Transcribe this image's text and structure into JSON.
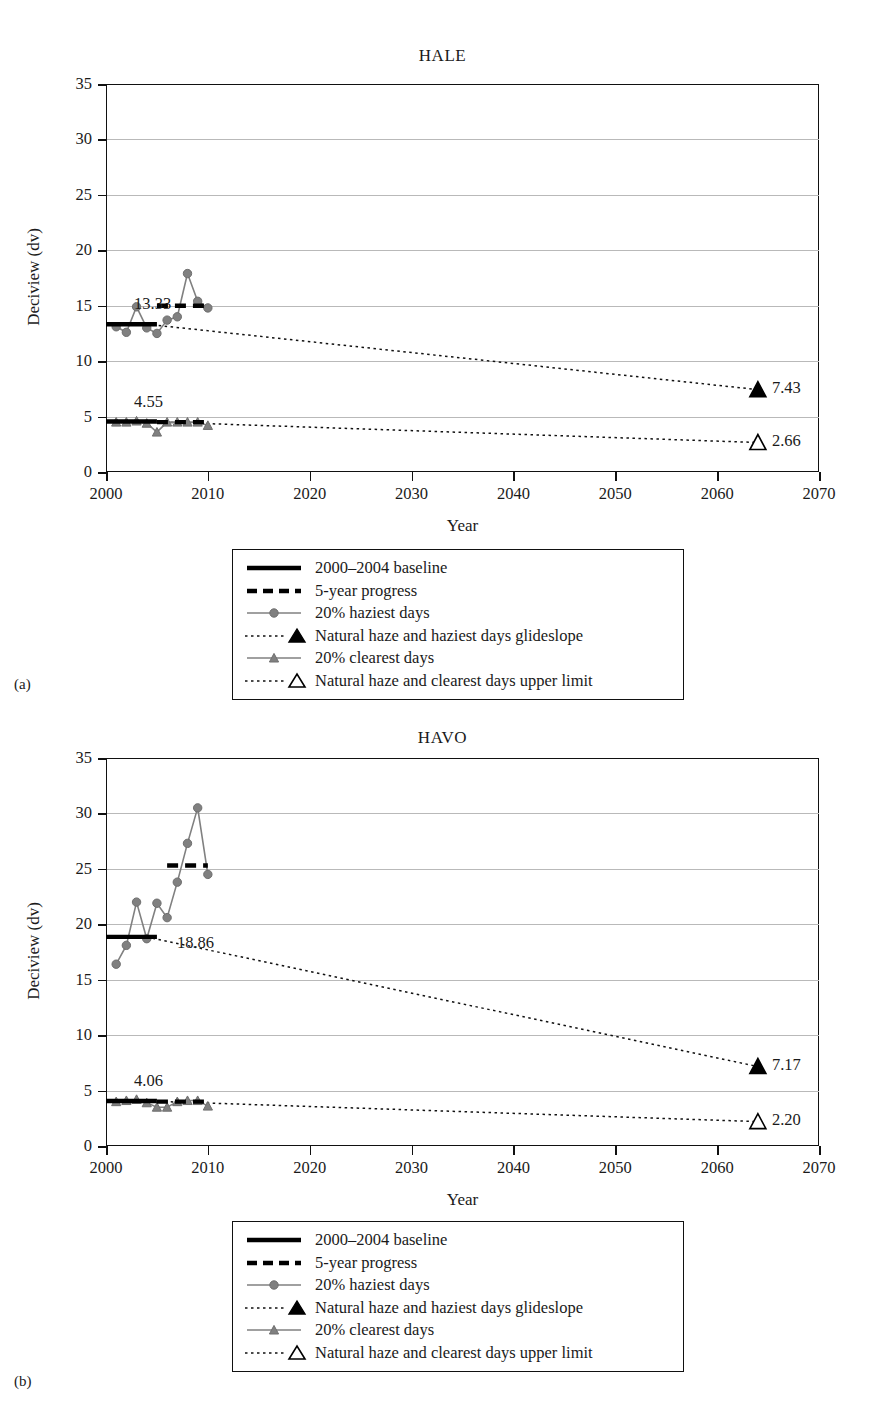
{
  "figure": {
    "y_axis_label": "Deciview (dv)",
    "x_axis_label": "Year",
    "y_ticks": [
      "0",
      "5",
      "10",
      "15",
      "20",
      "25",
      "30",
      "35"
    ],
    "x_ticks": [
      "2000",
      "2010",
      "2020",
      "2030",
      "2040",
      "2050",
      "2060",
      "2070"
    ],
    "ylim": [
      0,
      35
    ],
    "xlim": [
      2000,
      2070
    ],
    "colors": {
      "series_gray": "#808080",
      "baseline_black": "#000000",
      "gridline": "#b9b9b9",
      "axis": "#111111"
    }
  },
  "legend": {
    "items": [
      {
        "key": "solid-thick-black-line",
        "label": "2000–2004 baseline"
      },
      {
        "key": "dashed-thick-black-line",
        "label": "5-year progress"
      },
      {
        "key": "gray-line-circle-marker",
        "label": "20% haziest days"
      },
      {
        "key": "dotted-line-filled-triangle",
        "label": "Natural haze and haziest days glideslope"
      },
      {
        "key": "gray-line-triangle-marker",
        "label": "20% clearest days"
      },
      {
        "key": "dotted-line-open-triangle",
        "label": "Natural haze and clearest days upper limit"
      }
    ]
  },
  "panels": [
    {
      "id": "a",
      "subplot_label": "(a)",
      "title": "HALE",
      "chart_data": {
        "type": "line",
        "title": "HALE",
        "xlabel": "Year",
        "ylabel": "Deciview (dv)",
        "xlim": [
          2000,
          2070
        ],
        "ylim": [
          0,
          35
        ],
        "grid": true,
        "legend_position": "below-plot",
        "series": [
          {
            "name": "20% haziest days",
            "x": [
              2001,
              2002,
              2003,
              2004,
              2005,
              2006,
              2007,
              2008,
              2009,
              2010
            ],
            "values": [
              13.1,
              12.6,
              14.9,
              13.0,
              12.5,
              13.7,
              14.0,
              17.9,
              15.4,
              14.8
            ]
          },
          {
            "name": "20% clearest days",
            "x": [
              2001,
              2002,
              2003,
              2004,
              2005,
              2006,
              2007,
              2008,
              2009,
              2010
            ],
            "values": [
              4.5,
              4.5,
              4.6,
              4.4,
              3.6,
              4.5,
              4.5,
              4.5,
              4.5,
              4.2
            ]
          }
        ],
        "baselines": [
          {
            "name": "2000–2004 baseline haziest",
            "value": 13.33,
            "x_start": 2000,
            "x_end": 2005,
            "label": "13.33"
          },
          {
            "name": "2000–2004 baseline clearest",
            "value": 4.55,
            "x_start": 2000,
            "x_end": 2005,
            "label": "4.55"
          }
        ],
        "progress": [
          {
            "name": "5-year progress haziest",
            "value": 15.0,
            "x_start": 2005,
            "x_end": 2010
          },
          {
            "name": "5-year progress clearest",
            "value": 4.5,
            "x_start": 2005,
            "x_end": 2010
          }
        ],
        "glideslopes": [
          {
            "name": "Natural haze and haziest days glideslope",
            "x": [
              2004,
              2064
            ],
            "values": [
              13.33,
              7.43
            ],
            "endpoint_label": "7.43",
            "endpoint_marker": "filled-triangle"
          },
          {
            "name": "Natural haze and clearest days upper limit",
            "x": [
              2004,
              2064
            ],
            "values": [
              4.55,
              2.66
            ],
            "endpoint_label": "2.66",
            "endpoint_marker": "open-triangle"
          }
        ]
      }
    },
    {
      "id": "b",
      "subplot_label": "(b)",
      "title": "HAVO",
      "chart_data": {
        "type": "line",
        "title": "HAVO",
        "xlabel": "Year",
        "ylabel": "Deciview (dv)",
        "xlim": [
          2000,
          2070
        ],
        "ylim": [
          0,
          35
        ],
        "grid": true,
        "legend_position": "below-plot",
        "series": [
          {
            "name": "20% haziest days",
            "x": [
              2001,
              2002,
              2003,
              2004,
              2005,
              2006,
              2007,
              2008,
              2009,
              2010
            ],
            "values": [
              16.4,
              18.1,
              22.0,
              18.7,
              21.9,
              20.6,
              23.8,
              27.3,
              30.5,
              24.5
            ]
          },
          {
            "name": "20% clearest days",
            "x": [
              2001,
              2002,
              2003,
              2004,
              2005,
              2006,
              2007,
              2008,
              2009,
              2010
            ],
            "values": [
              4.0,
              4.1,
              4.2,
              3.9,
              3.5,
              3.5,
              4.0,
              4.1,
              4.1,
              3.6
            ]
          }
        ],
        "baselines": [
          {
            "name": "2000–2004 baseline haziest",
            "value": 18.86,
            "x_start": 2000,
            "x_end": 2005,
            "label": "18.86"
          },
          {
            "name": "2000–2004 baseline clearest",
            "value": 4.06,
            "x_start": 2000,
            "x_end": 2005,
            "label": "4.06"
          }
        ],
        "progress": [
          {
            "name": "5-year progress haziest",
            "value": 25.3,
            "x_start": 2006,
            "x_end": 2010
          },
          {
            "name": "5-year progress clearest",
            "value": 4.0,
            "x_start": 2005,
            "x_end": 2010
          }
        ],
        "glideslopes": [
          {
            "name": "Natural haze and haziest days glideslope",
            "x": [
              2004,
              2064
            ],
            "values": [
              18.86,
              7.17
            ],
            "endpoint_label": "7.17",
            "endpoint_marker": "filled-triangle"
          },
          {
            "name": "Natural haze and clearest days upper limit",
            "x": [
              2004,
              2064
            ],
            "values": [
              4.06,
              2.2
            ],
            "endpoint_label": "2.20",
            "endpoint_marker": "open-triangle"
          }
        ]
      }
    }
  ]
}
